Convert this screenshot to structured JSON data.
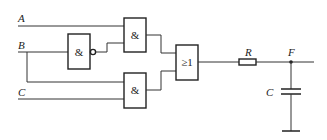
{
  "diagram": {
    "type": "logic-circuit",
    "inputs": [
      {
        "id": "A",
        "label": "A"
      },
      {
        "id": "B",
        "label": "B"
      },
      {
        "id": "C",
        "label": "C"
      }
    ],
    "gates": {
      "and1": {
        "symbol": "&"
      },
      "nand": {
        "symbol": "&"
      },
      "and2": {
        "symbol": "&"
      },
      "or": {
        "symbol": "≥1"
      }
    },
    "components": {
      "resistor": {
        "label": "R"
      },
      "capacitor": {
        "label": "C"
      },
      "output_node": {
        "label": "F"
      }
    },
    "colors": {
      "line": "#333333",
      "background": "#ffffff"
    }
  }
}
